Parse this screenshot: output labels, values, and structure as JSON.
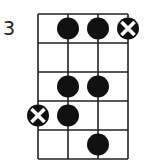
{
  "diagram": {
    "type": "chord-diagram",
    "start_fret_label": "3",
    "num_strings": 4,
    "num_frets": 5,
    "colors": {
      "line": "#222222",
      "dot": "#111111",
      "mute_mark": "#ffffff",
      "background": "#ffffff"
    },
    "markers": [
      {
        "fret": 1,
        "string": 2,
        "kind": "dot"
      },
      {
        "fret": 1,
        "string": 3,
        "kind": "dot"
      },
      {
        "fret": 1,
        "string": 4,
        "kind": "x"
      },
      {
        "fret": 3,
        "string": 2,
        "kind": "dot"
      },
      {
        "fret": 3,
        "string": 3,
        "kind": "dot"
      },
      {
        "fret": 4,
        "string": 1,
        "kind": "x"
      },
      {
        "fret": 4,
        "string": 2,
        "kind": "dot"
      },
      {
        "fret": 5,
        "string": 3,
        "kind": "dot"
      }
    ]
  }
}
